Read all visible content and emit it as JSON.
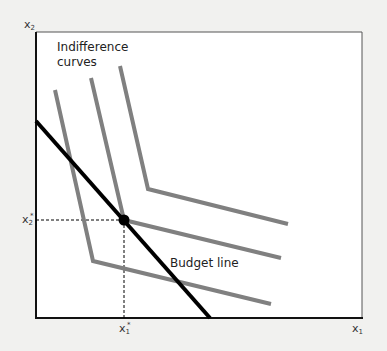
{
  "diagram": {
    "axes": {
      "x_label": "x",
      "x_sub": "1",
      "y_label": "x",
      "y_sub": "2",
      "x_star_label": "x",
      "x_star_sub": "1",
      "x_star_sup": "*",
      "y_star_label": "x",
      "y_star_sub": "2",
      "y_star_sup": "*"
    },
    "annotations": {
      "indifference_line1": "Indifference",
      "indifference_line2": "curves",
      "budget_line": "Budget line"
    },
    "colors": {
      "background": "#f1f1ef",
      "plot_area": "#ffffff",
      "indifference_curve": "#808080",
      "budget_line": "#000000",
      "guide": "#000000"
    },
    "indifference_curves": [
      {
        "name": "curve-1",
        "points": [
          [
            55,
            90
          ],
          [
            93,
            261
          ],
          [
            271,
            304
          ]
        ]
      },
      {
        "name": "curve-2",
        "points": [
          [
            91,
            78
          ],
          [
            124,
            220
          ],
          [
            281,
            258
          ]
        ]
      },
      {
        "name": "curve-3",
        "points": [
          [
            120,
            66
          ],
          [
            148,
            189
          ],
          [
            288,
            224
          ]
        ]
      }
    ],
    "budget_line": {
      "from": [
        36,
        121
      ],
      "to": [
        210,
        318
      ]
    },
    "optimum": {
      "x": 124,
      "y": 220
    }
  }
}
